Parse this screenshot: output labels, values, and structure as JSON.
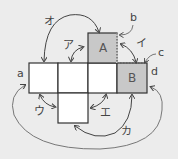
{
  "diagram": {
    "type": "cube-net",
    "colors": {
      "background": "#ececec",
      "face": "#ffffff",
      "shaded_face": "#c8c8c8",
      "stroke": "#333333",
      "arrow": "#444444"
    },
    "faces": [
      {
        "id": "A",
        "label": "A",
        "shaded": true
      },
      {
        "id": "B",
        "label": "B",
        "shaded": true
      }
    ],
    "edge_labels": {
      "a": "a",
      "b": "b",
      "c": "c",
      "d": "d"
    },
    "arrow_labels": {
      "a1": "ア",
      "i": "イ",
      "u": "ウ",
      "e": "エ",
      "o": "オ",
      "ka": "カ"
    }
  }
}
